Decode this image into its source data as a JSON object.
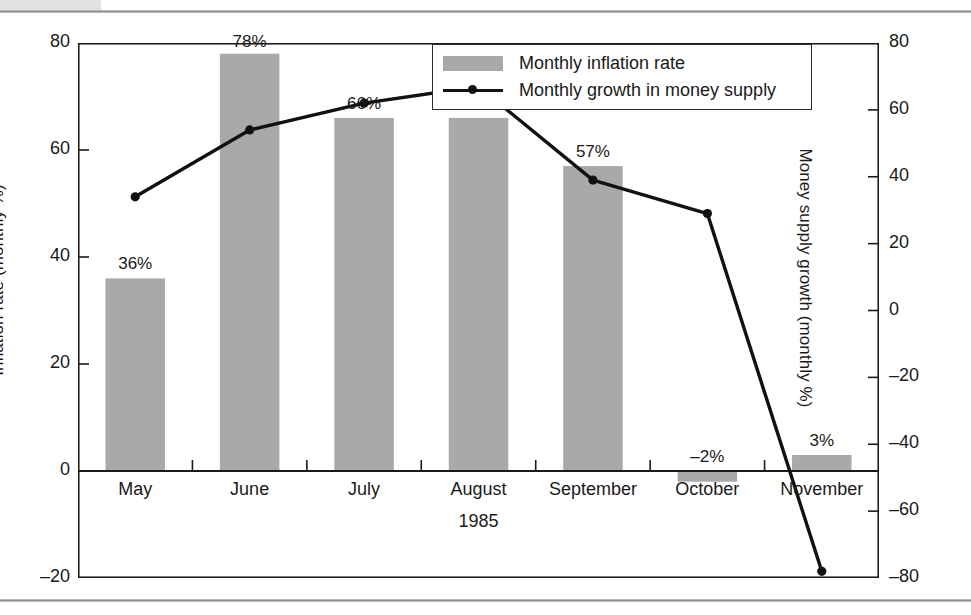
{
  "figure": {
    "background_color": "#ffffff",
    "rule_color": "#8f8f8f"
  },
  "chart_data": {
    "type": "bar",
    "title": "",
    "subtitle": "",
    "xlabel": "1985",
    "ylabel": "Inflation rate (monthly %)",
    "ylabel_secondary": "Money supply growth (monthly %)",
    "categories": [
      "May",
      "June",
      "July",
      "August",
      "September",
      "October",
      "November"
    ],
    "ylim": [
      -20,
      80
    ],
    "ylim_secondary": [
      -80,
      80
    ],
    "yticks": [
      80,
      60,
      40,
      20,
      0,
      -20
    ],
    "ytick_labels": [
      "80",
      "60",
      "40",
      "20",
      "0",
      "–20"
    ],
    "yticks_secondary": [
      80,
      60,
      40,
      20,
      0,
      -20,
      -40,
      -60,
      -80
    ],
    "ytick_labels_secondary": [
      "80",
      "60",
      "40",
      "20",
      "0",
      "–20",
      "–40",
      "–60",
      "–80"
    ],
    "grid": false,
    "legend_position": "top-right",
    "series": [
      {
        "name": "Monthly inflation rate",
        "kind": "bar",
        "axis": "left",
        "color": "#a9a9a9",
        "values": [
          36,
          78,
          66,
          66,
          57,
          -2,
          3
        ],
        "data_labels": [
          "36%",
          "78%",
          "66%",
          "66%",
          "57%",
          "–2%",
          "3%"
        ]
      },
      {
        "name": "Monthly growth in money supply",
        "kind": "line",
        "axis": "right",
        "color": "#111111",
        "values": [
          34,
          54,
          62,
          67,
          39,
          29,
          -78
        ],
        "data_labels": []
      }
    ]
  },
  "legend": {
    "items": [
      {
        "label": "Monthly inflation rate",
        "marker": "swatch"
      },
      {
        "label": "Monthly growth in money supply",
        "marker": "line-with-dot"
      }
    ]
  }
}
